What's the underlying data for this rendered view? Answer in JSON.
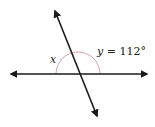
{
  "diagram": {
    "type": "intersecting-lines",
    "labels": {
      "x": "x",
      "y_var": "y",
      "y_eq": " = 112°"
    },
    "colors": {
      "line": "#1a1a1a",
      "arc": "#d9a0a8",
      "text": "#222222"
    },
    "angles": {
      "y_degrees": 112
    }
  }
}
